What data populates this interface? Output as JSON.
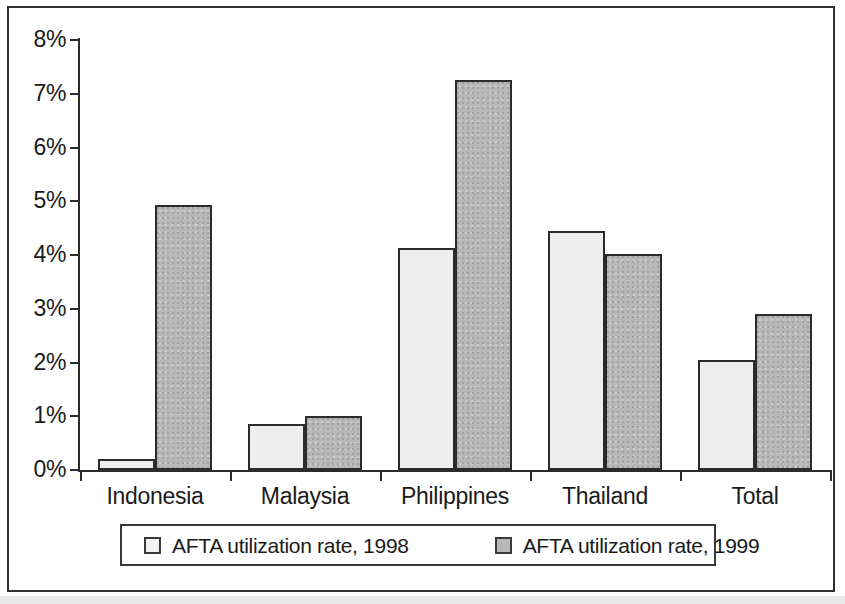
{
  "chart_data": {
    "type": "bar",
    "title": "",
    "xlabel": "",
    "ylabel": "",
    "ylim": [
      0,
      8
    ],
    "y_unit": "%",
    "grid": false,
    "legend_position": "bottom",
    "categories": [
      "Indonesia",
      "Malaysia",
      "Philippines",
      "Thailand",
      "Total"
    ],
    "ytick_labels": [
      "0%",
      "1%",
      "2%",
      "3%",
      "4%",
      "5%",
      "6%",
      "7%",
      "8%"
    ],
    "ytick_values": [
      0,
      1,
      2,
      3,
      4,
      5,
      6,
      7,
      8
    ],
    "series": [
      {
        "name": "AFTA utilization rate, 1998",
        "color": "#eeeeee",
        "values": [
          0.2,
          0.86,
          4.13,
          4.45,
          2.05
        ]
      },
      {
        "name": "AFTA utilization rate, 1999",
        "color": "#b8b8b8",
        "values": [
          4.93,
          1.0,
          7.25,
          4.02,
          2.9
        ]
      }
    ]
  },
  "legend": {
    "entries": [
      {
        "label": "AFTA utilization rate, 1998"
      },
      {
        "label": "AFTA utilization rate, 1999"
      }
    ]
  },
  "axis": {
    "y_ticks": [
      {
        "label": "8%",
        "value": 8
      },
      {
        "label": "7%",
        "value": 7
      },
      {
        "label": "6%",
        "value": 6
      },
      {
        "label": "5%",
        "value": 5
      },
      {
        "label": "4%",
        "value": 4
      },
      {
        "label": "3%",
        "value": 3
      },
      {
        "label": "2%",
        "value": 2
      },
      {
        "label": "1%",
        "value": 1
      },
      {
        "label": "0%",
        "value": 0
      }
    ],
    "categories": [
      {
        "label": "Indonesia"
      },
      {
        "label": "Malaysia"
      },
      {
        "label": "Philippines"
      },
      {
        "label": "Thailand"
      },
      {
        "label": "Total"
      }
    ]
  }
}
